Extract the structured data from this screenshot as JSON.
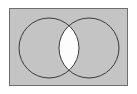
{
  "figure": {
    "width": 137,
    "height": 94,
    "background_color": "#ffffff"
  },
  "chart_data": {
    "type": "diagram",
    "diagram_type": "venn",
    "title": "",
    "subtitle": "",
    "xlabel": "",
    "ylabel": "",
    "grid": false,
    "legend": false,
    "sets": [
      {
        "name": "A",
        "label": "",
        "shape": "circle",
        "cx": 49,
        "cy": 48,
        "r": 30,
        "fill": "none",
        "stroke": "#3a3a3a"
      },
      {
        "name": "B",
        "label": "",
        "shape": "circle",
        "cx": 89,
        "cy": 48,
        "r": 30,
        "fill": "none",
        "stroke": "#3a3a3a"
      }
    ],
    "regions": [
      {
        "name": "universe",
        "expression": "U",
        "shaded": false,
        "fill": "#c4c4c4"
      },
      {
        "name": "A-only",
        "expression": "A \\ B",
        "shaded": false,
        "fill": "#c4c4c4"
      },
      {
        "name": "B-only",
        "expression": "B \\ A",
        "shaded": false,
        "fill": "#c4c4c4"
      },
      {
        "name": "intersection",
        "expression": "A ∩ B",
        "shaded": true,
        "fill": "#fdfdfd"
      }
    ],
    "annotations": [],
    "universe_box": {
      "x": 9,
      "y": 8,
      "width": 119,
      "height": 78,
      "fill": "#c4c4c4",
      "stroke": "#6e6e6e"
    }
  },
  "colors": {
    "page_background": "#ffffff",
    "universe_fill": "#c4c4c4",
    "universe_border": "#6e6e6e",
    "circle_stroke": "#3a3a3a",
    "intersection_fill": "#fdfdfd"
  }
}
